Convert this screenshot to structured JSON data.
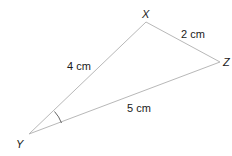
{
  "diagram": {
    "type": "triangle",
    "vertices": {
      "X": {
        "label": "X"
      },
      "Y": {
        "label": "Y"
      },
      "Z": {
        "label": "Z"
      }
    },
    "sides": {
      "XY": {
        "label": "4 cm"
      },
      "XZ": {
        "label": "2 cm"
      },
      "YZ": {
        "label": "5 cm"
      }
    },
    "angle_marked": "Y",
    "line_color": "#b8b8b8",
    "arc_color": "#555555"
  }
}
